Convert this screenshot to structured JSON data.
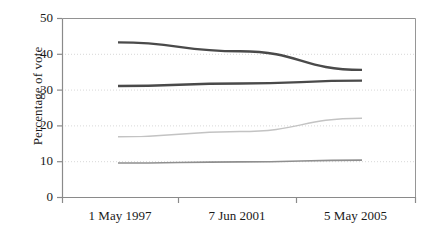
{
  "chart_data": {
    "type": "line",
    "title": "",
    "subtitle": "",
    "xlabel": "",
    "ylabel": "Percentage of vote",
    "categories": [
      "1 May 1997",
      "7 Jun 2001",
      "5 May 2005"
    ],
    "x_tick_labels": [
      "1 May 1997",
      "7 Jun 2001",
      "5 May 2005"
    ],
    "y_tick_labels": [
      "0",
      "10",
      "20",
      "30",
      "40",
      "50"
    ],
    "y_ticks": [
      0,
      10,
      20,
      30,
      40,
      50
    ],
    "ylim": [
      0,
      50
    ],
    "grid": "horizontal-dotted",
    "legend": "none",
    "series": [
      {
        "name": "series-1",
        "values": [
          43.2,
          40.7,
          35.5
        ],
        "color": "#4a4a4a",
        "width": 2.4
      },
      {
        "name": "series-2",
        "values": [
          31.0,
          31.7,
          32.5
        ],
        "color": "#4a4a4a",
        "width": 2.4
      },
      {
        "name": "series-3",
        "values": [
          16.8,
          18.3,
          22.0
        ],
        "color": "#c3c3c3",
        "width": 1.5
      },
      {
        "name": "series-4",
        "values": [
          9.5,
          9.8,
          10.3
        ],
        "color": "#8f8f8f",
        "width": 1.6
      }
    ],
    "colors": {
      "axis": "#8a8a8a",
      "gridline": "#d8d8d8",
      "plot_background": "#ffffff",
      "text": "#1a1a1a"
    }
  },
  "axis": {
    "y_title": "Percentage of vote"
  }
}
